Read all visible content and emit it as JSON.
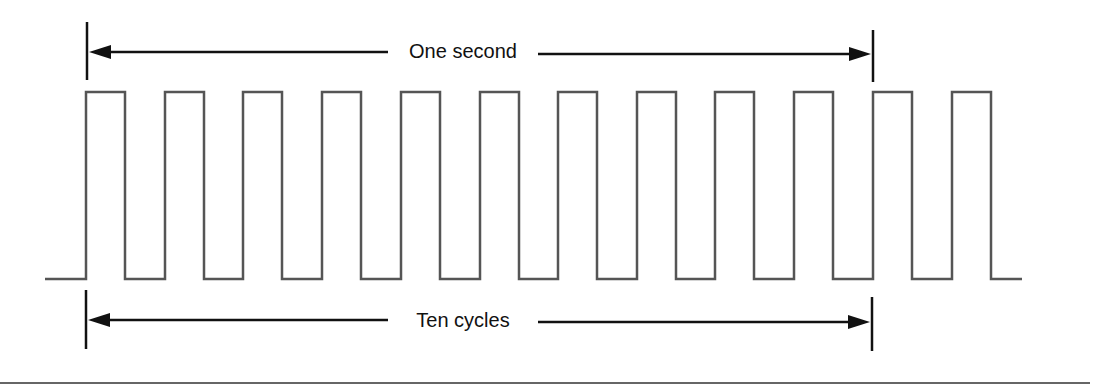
{
  "diagram": {
    "type": "square-wave-timing",
    "top_dimension": {
      "label": "One second",
      "x_start": 87,
      "x_end": 873,
      "y": 52
    },
    "bottom_dimension": {
      "label": "Ten cycles",
      "x_start": 86,
      "x_end": 872,
      "y": 320
    },
    "waveform": {
      "baseline_start_x": 45,
      "baseline_end_x": 1022,
      "high_y": 92,
      "low_y": 279,
      "pulse_width": 39,
      "pulse_rise_x": [
        86,
        165,
        243,
        322,
        401,
        480,
        558,
        637,
        715,
        794,
        873,
        952
      ],
      "pulse_count": 12
    },
    "colors": {
      "waveform": "#555555",
      "dimension_lines": "#111111",
      "text": "#111111",
      "bottom_rule": "#666666"
    }
  }
}
